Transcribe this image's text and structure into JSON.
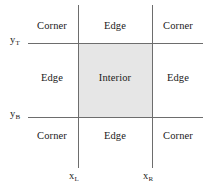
{
  "diagram": {
    "colors": {
      "interior_fill": "#e6e6e6",
      "line": "#6d6d6d",
      "text": "#1a1a1a",
      "background": "#ffffff"
    },
    "regions": {
      "top_left": "Corner",
      "top_center": "Edge",
      "top_right": "Corner",
      "middle_left": "Edge",
      "middle_center": "Interior",
      "middle_right": "Edge",
      "bottom_left": "Corner",
      "bottom_center": "Edge",
      "bottom_right": "Corner"
    },
    "axis_labels": {
      "y_top": {
        "base": "y",
        "sub": "T"
      },
      "y_bottom": {
        "base": "y",
        "sub": "B"
      },
      "x_left": {
        "base": "x",
        "sub": "L"
      },
      "x_right": {
        "base": "x",
        "sub": "R"
      }
    }
  }
}
